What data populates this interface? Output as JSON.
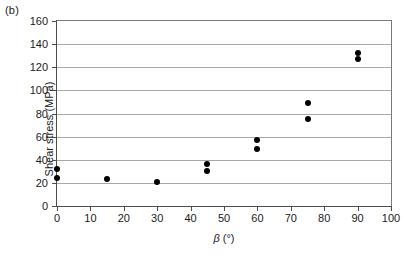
{
  "figure": {
    "panel_label": "(b)"
  },
  "chart_data": {
    "type": "scatter",
    "title": "",
    "xlabel": "β (°)",
    "xlabel_symbol": "β",
    "xlabel_unit": "(°)",
    "ylabel": "Shear stress (MPa)",
    "xlim": [
      0,
      100
    ],
    "ylim": [
      0,
      160
    ],
    "xticks": [
      0,
      10,
      20,
      30,
      40,
      50,
      60,
      70,
      80,
      90,
      100
    ],
    "yticks": [
      0,
      20,
      40,
      60,
      80,
      100,
      120,
      140,
      160
    ],
    "grid": "horizontal",
    "legend": "none",
    "marker": "filled-circle",
    "marker_color": "#000000",
    "series": [
      {
        "name": "Shear stress measurements",
        "points": [
          {
            "x": 0,
            "y": 32
          },
          {
            "x": 0,
            "y": 24
          },
          {
            "x": 15,
            "y": 23
          },
          {
            "x": 30,
            "y": 21
          },
          {
            "x": 45,
            "y": 36
          },
          {
            "x": 45,
            "y": 30
          },
          {
            "x": 60,
            "y": 57
          },
          {
            "x": 60,
            "y": 49
          },
          {
            "x": 75,
            "y": 89
          },
          {
            "x": 75,
            "y": 75
          },
          {
            "x": 90,
            "y": 132
          },
          {
            "x": 90,
            "y": 127
          }
        ]
      }
    ]
  }
}
